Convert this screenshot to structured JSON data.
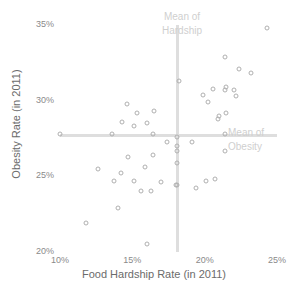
{
  "chart_data": {
    "type": "scatter",
    "title": "",
    "xlabel": "Food Hardship Rate (in 2011)",
    "ylabel": "Obesity Rate (in 2011)",
    "xlim": [
      10,
      25
    ],
    "ylim": [
      20,
      35
    ],
    "xticks": [
      "10%",
      "15%",
      "20%",
      "25%"
    ],
    "xtick_values": [
      10,
      15,
      20,
      25
    ],
    "yticks": [
      "20%",
      "25%",
      "30%",
      "35%"
    ],
    "ytick_values": [
      20,
      25,
      30,
      35
    ],
    "grid": false,
    "legend": "none",
    "point_style": "open-circle",
    "point_color": "#b0b0b0",
    "reference_line_color": "#dedede",
    "annotations": [
      {
        "name": "mean-of-hardship",
        "text_line1": "Mean of",
        "text_line2": "Hardship",
        "axis": "x",
        "value": 18.1
      },
      {
        "name": "mean-of-obesity",
        "text_line1": "Mean of",
        "text_line2": "Obesity",
        "axis": "y",
        "value": 27.7
      }
    ],
    "reference_lines": {
      "mean_hardship_x": 18.1,
      "mean_obesity_y": 27.7
    },
    "points": [
      {
        "x": 24.3,
        "y": 34.8
      },
      {
        "x": 21.4,
        "y": 32.9
      },
      {
        "x": 22.4,
        "y": 32.1
      },
      {
        "x": 23.2,
        "y": 31.8
      },
      {
        "x": 18.2,
        "y": 31.3
      },
      {
        "x": 20.6,
        "y": 30.8
      },
      {
        "x": 21.5,
        "y": 30.9
      },
      {
        "x": 21.4,
        "y": 30.7
      },
      {
        "x": 22.0,
        "y": 30.7
      },
      {
        "x": 19.9,
        "y": 30.4
      },
      {
        "x": 22.2,
        "y": 30.3
      },
      {
        "x": 20.2,
        "y": 29.9
      },
      {
        "x": 14.6,
        "y": 29.8
      },
      {
        "x": 16.5,
        "y": 29.3
      },
      {
        "x": 15.3,
        "y": 29.2
      },
      {
        "x": 21.5,
        "y": 29.2
      },
      {
        "x": 21.0,
        "y": 29.0
      },
      {
        "x": 20.9,
        "y": 28.8
      },
      {
        "x": 14.3,
        "y": 28.6
      },
      {
        "x": 16.0,
        "y": 28.5
      },
      {
        "x": 15.1,
        "y": 28.3
      },
      {
        "x": 10.0,
        "y": 27.8
      },
      {
        "x": 13.6,
        "y": 27.8
      },
      {
        "x": 16.4,
        "y": 27.8
      },
      {
        "x": 21.4,
        "y": 27.8
      },
      {
        "x": 18.1,
        "y": 27.6
      },
      {
        "x": 17.4,
        "y": 27.3
      },
      {
        "x": 19.1,
        "y": 27.3
      },
      {
        "x": 18.1,
        "y": 27.0
      },
      {
        "x": 21.4,
        "y": 26.7
      },
      {
        "x": 18.1,
        "y": 26.7
      },
      {
        "x": 16.4,
        "y": 26.4
      },
      {
        "x": 14.7,
        "y": 26.3
      },
      {
        "x": 18.1,
        "y": 25.9
      },
      {
        "x": 15.9,
        "y": 25.6
      },
      {
        "x": 14.2,
        "y": 25.2
      },
      {
        "x": 12.6,
        "y": 25.5
      },
      {
        "x": 13.7,
        "y": 24.7
      },
      {
        "x": 20.1,
        "y": 24.7
      },
      {
        "x": 20.7,
        "y": 24.8
      },
      {
        "x": 15.1,
        "y": 24.7
      },
      {
        "x": 17.0,
        "y": 24.6
      },
      {
        "x": 18.0,
        "y": 24.4
      },
      {
        "x": 18.1,
        "y": 24.4
      },
      {
        "x": 19.4,
        "y": 24.2
      },
      {
        "x": 15.6,
        "y": 24.0
      },
      {
        "x": 16.3,
        "y": 24.0
      },
      {
        "x": 14.0,
        "y": 22.9
      },
      {
        "x": 11.8,
        "y": 21.9
      },
      {
        "x": 16.0,
        "y": 20.5
      }
    ]
  }
}
